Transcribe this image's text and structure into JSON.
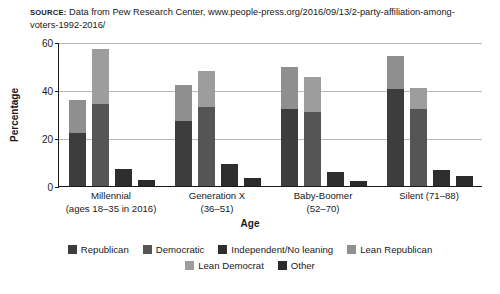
{
  "source": {
    "label": "SOURCE:",
    "text": " Data from Pew Research Center, www.people-press.org/2016/09/13/2-party-affiliation-among-voters-1992-2016/"
  },
  "chart_data": {
    "type": "bar",
    "subtype": "stacked-grouped",
    "title": "",
    "xlabel": "Age",
    "ylabel": "Percentage",
    "ylim": [
      0,
      60
    ],
    "yticks": [
      0,
      20,
      40,
      60
    ],
    "grid": true,
    "legend_position": "bottom",
    "categories": [
      "Millennial",
      "Generation X",
      "Baby-Boomer",
      "Silent (71–88)"
    ],
    "category_sublabels": [
      "(ages 18–35 in 2016)",
      "(36–51)",
      "(52–70)",
      ""
    ],
    "bars_per_group": [
      "Republican stack",
      "Democratic stack",
      "Independent/No leaning",
      "Other"
    ],
    "series": [
      {
        "name": "Republican",
        "color": "#3d3d3d",
        "stack": 0,
        "values": [
          22,
          27,
          32,
          40.5
        ]
      },
      {
        "name": "Lean Republican",
        "color": "#8f8f8f",
        "stack": 0,
        "values": [
          14,
          15,
          17.5,
          13.5
        ]
      },
      {
        "name": "Democratic",
        "color": "#555555",
        "stack": 1,
        "values": [
          34,
          33,
          31,
          32
        ]
      },
      {
        "name": "Lean Democrat",
        "color": "#9d9d9d",
        "stack": 1,
        "values": [
          23,
          15,
          14.5,
          9
        ]
      },
      {
        "name": "Independent/No leaning",
        "color": "#2e2e2e",
        "stack": 2,
        "values": [
          7,
          9,
          6,
          6.5
        ]
      },
      {
        "name": "Other",
        "color": "#2b2b2b",
        "stack": 3,
        "values": [
          2.5,
          3.5,
          2,
          4
        ]
      }
    ],
    "stack_totals": {
      "Republican stack": [
        36,
        42,
        49.5,
        54
      ],
      "Democratic stack": [
        57,
        48,
        45.5,
        41
      ]
    }
  },
  "legend": {
    "row1": [
      {
        "label": "Republican",
        "color": "#3d3d3d"
      },
      {
        "label": "Democratic",
        "color": "#555555"
      },
      {
        "label": "Independent/No leaning",
        "color": "#2e2e2e"
      },
      {
        "label": "Lean Republican",
        "color": "#8f8f8f"
      }
    ],
    "row2": [
      {
        "label": "Lean Democrat",
        "color": "#9d9d9d"
      },
      {
        "label": "Other",
        "color": "#2b2b2b"
      }
    ]
  }
}
